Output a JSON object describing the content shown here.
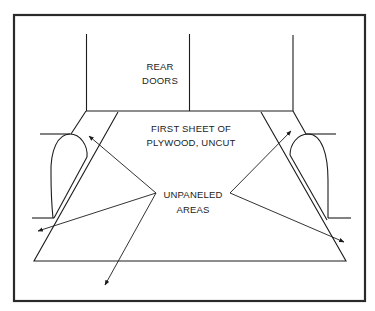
{
  "diagram": {
    "type": "van floor plywood paneling diagram",
    "labels": {
      "rear_doors": [
        "REAR",
        "DOORS"
      ],
      "first_sheet": [
        "FIRST SHEET OF",
        "PLYWOOD, UNCUT"
      ],
      "unpaneled": [
        "UNPANELED",
        "AREAS"
      ]
    },
    "colors": {
      "line": "#1c1c1c",
      "background": "#ffffff"
    }
  }
}
